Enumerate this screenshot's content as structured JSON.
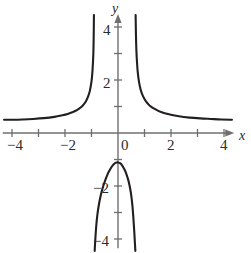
{
  "figure": {
    "background_color": "#ffffff",
    "curve_color": "#231f20",
    "axis_color": "#6f6f6f",
    "label_color": "#2b2b2b"
  },
  "axes": {
    "x_name": "x",
    "y_name": "y",
    "x_labels": [
      "−4",
      "−2",
      "0",
      "2",
      "4"
    ],
    "y_labels": [
      "4",
      "2",
      "−2",
      "−4"
    ]
  },
  "chart_data": {
    "type": "line",
    "title": "",
    "subtitle": "",
    "xlabel": "x",
    "ylabel": "y",
    "xlim": [
      -4.35,
      4.35
    ],
    "ylim": [
      -4.35,
      4.45
    ],
    "xticks": [
      -4,
      -3,
      -2,
      -1,
      0,
      1,
      2,
      3,
      4
    ],
    "yticks": [
      -4,
      -3,
      -2,
      -1,
      1,
      2,
      3,
      4
    ],
    "xtick_labels": [
      "−4",
      "",
      "−2",
      "",
      "0",
      "",
      "2",
      "",
      "4"
    ],
    "ytick_labels": [
      "−4",
      "",
      "−2",
      "",
      "",
      "2",
      "",
      "4"
    ],
    "grid": false,
    "legend": null,
    "annotations": [],
    "vertical_asymptotes": [
      -0.9,
      0.65
    ],
    "horizontal_asymptote": 0.5,
    "series": [
      {
        "name": "left-upper-branch",
        "x": [
          -4.3,
          -4.0,
          -3.6,
          -3.2,
          -2.8,
          -2.4,
          -2.1,
          -1.9,
          -1.7,
          -1.55,
          -1.4,
          -1.3,
          -1.2,
          -1.12,
          -1.06,
          -1.0,
          -0.97,
          -0.945,
          -0.93,
          -0.92,
          -0.913,
          -0.908
        ],
        "y": [
          0.5,
          0.5,
          0.51,
          0.53,
          0.56,
          0.61,
          0.67,
          0.72,
          0.79,
          0.86,
          0.97,
          1.07,
          1.22,
          1.4,
          1.6,
          1.95,
          2.25,
          2.65,
          3.0,
          3.45,
          4.0,
          4.45
        ]
      },
      {
        "name": "right-upper-branch",
        "x": [
          0.665,
          0.672,
          0.682,
          0.695,
          0.715,
          0.745,
          0.79,
          0.85,
          0.93,
          1.05,
          1.2,
          1.4,
          1.65,
          1.95,
          2.3,
          2.7,
          3.1,
          3.5,
          3.9,
          4.3
        ],
        "y": [
          4.45,
          4.0,
          3.5,
          3.1,
          2.7,
          2.3,
          1.95,
          1.65,
          1.42,
          1.2,
          1.03,
          0.9,
          0.78,
          0.7,
          0.63,
          0.58,
          0.55,
          0.53,
          0.51,
          0.5
        ]
      },
      {
        "name": "lower-branch",
        "x": [
          -0.88,
          -0.855,
          -0.82,
          -0.78,
          -0.72,
          -0.65,
          -0.57,
          -0.48,
          -0.39,
          -0.3,
          -0.2,
          -0.1,
          -0.05,
          0.0,
          0.08,
          0.16,
          0.24,
          0.31,
          0.38,
          0.44,
          0.5,
          0.545,
          0.58,
          0.61,
          0.635,
          0.655
        ],
        "y": [
          -4.45,
          -4.0,
          -3.5,
          -3.1,
          -2.7,
          -2.35,
          -2.05,
          -1.78,
          -1.55,
          -1.38,
          -1.22,
          -1.13,
          -1.11,
          -1.11,
          -1.14,
          -1.23,
          -1.37,
          -1.53,
          -1.75,
          -2.0,
          -2.35,
          -2.75,
          -3.2,
          -3.65,
          -4.1,
          -4.45
        ]
      }
    ]
  }
}
